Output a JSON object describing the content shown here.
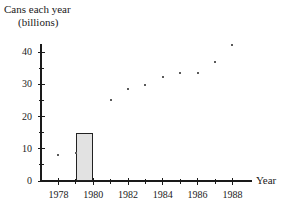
{
  "chart_data": {
    "type": "scatter",
    "title": "",
    "ylabel_line1": "Cans each year",
    "ylabel_line2": "(billions)",
    "xlabel": "Year",
    "x": [
      1978,
      1979,
      1981,
      1982,
      1983,
      1984,
      1985,
      1986,
      1987,
      1988
    ],
    "values": [
      8,
      8.7,
      25.2,
      28.5,
      29.7,
      32.2,
      33.5,
      33.6,
      37,
      42.3
    ],
    "xlim": [
      1977,
      1989
    ],
    "ylim": [
      0,
      44
    ],
    "ytick_labels": [
      "0",
      "10",
      "20",
      "30",
      "40"
    ],
    "ytick_values": [
      0,
      10,
      20,
      30,
      40
    ],
    "yminor_values": [
      5,
      15,
      25,
      35
    ],
    "xtick_labels": [
      "1978",
      "1980",
      "1982",
      "1984",
      "1986",
      "1988"
    ],
    "xtick_values": [
      1978,
      1980,
      1982,
      1984,
      1986,
      1988
    ],
    "xminor_values": [
      1979,
      1981,
      1983,
      1985,
      1987
    ],
    "grid": false,
    "legend": "none",
    "highlight_bar": {
      "label": "1979",
      "x_start": 1979,
      "x_end": 1980,
      "height": 15,
      "fill": "#e2e2e2",
      "stroke": "#222222"
    },
    "point_color": "#5a5a5a",
    "axis_color": "#1a1a1a"
  }
}
